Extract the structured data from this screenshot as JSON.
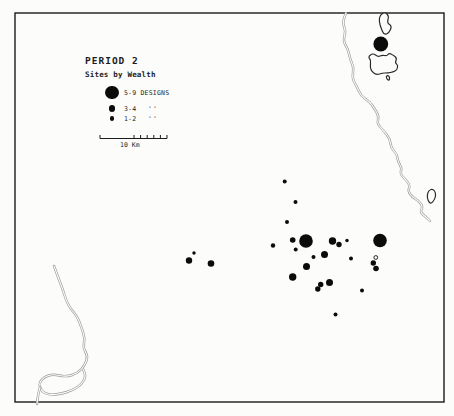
{
  "figure": {
    "title": "PERIOD 2",
    "subtitle": "Sites by Wealth",
    "legend": [
      {
        "label": "5-9 DESIGNS",
        "ditto": "",
        "radius": 6.8
      },
      {
        "label": "3-4",
        "ditto": "''",
        "radius": 3.4
      },
      {
        "label": "1-2",
        "ditto": "''",
        "radius": 2.1
      }
    ],
    "scale_bar": {
      "label": "10 Km"
    },
    "colors": {
      "ink": "#1c1c1c",
      "dot": "#0b0b0b",
      "river": "#9c9c9c",
      "island": "#2b2b2b",
      "background": "#fcfcfb"
    }
  },
  "chart_data": {
    "type": "scatter",
    "legend_entries": [
      "5-9 DESIGNS",
      "3-4 ''",
      "1-2 ''"
    ],
    "size_classes": {
      "5-9": 6.8,
      "3-4": 3.4,
      "1-2": 2
    },
    "frame": {
      "x": 15,
      "y": 13,
      "w": 429,
      "h": 389
    },
    "scale_bar": {
      "x1": 100,
      "x2": 167,
      "y": 138.5,
      "tick_h": 3.5,
      "ticks": [
        100,
        134,
        140.6,
        147.2,
        153.8,
        160.4,
        167
      ],
      "label": "10 Km"
    },
    "sites": [
      {
        "x": 284.7,
        "y": 181.5,
        "r": 2,
        "wealth": "1-2"
      },
      {
        "x": 295.5,
        "y": 202,
        "r": 2,
        "wealth": "1-2"
      },
      {
        "x": 287,
        "y": 222,
        "r": 2,
        "wealth": "1-2"
      },
      {
        "x": 273,
        "y": 245.5,
        "r": 2.2,
        "wealth": "1-2"
      },
      {
        "x": 292.7,
        "y": 240,
        "r": 2.8,
        "wealth": "3-4"
      },
      {
        "x": 306,
        "y": 241,
        "r": 6.8,
        "wealth": "5-9"
      },
      {
        "x": 295.7,
        "y": 249.5,
        "r": 2,
        "wealth": "1-2"
      },
      {
        "x": 313.5,
        "y": 257,
        "r": 2,
        "wealth": "1-2"
      },
      {
        "x": 324.5,
        "y": 254.5,
        "r": 3.5,
        "wealth": "3-4"
      },
      {
        "x": 332.5,
        "y": 241,
        "r": 3.7,
        "wealth": "3-4"
      },
      {
        "x": 339,
        "y": 244.5,
        "r": 2.7,
        "wealth": "3-4"
      },
      {
        "x": 347,
        "y": 240.5,
        "r": 1.7,
        "wealth": "1-2"
      },
      {
        "x": 351,
        "y": 258.5,
        "r": 2,
        "wealth": "1-2"
      },
      {
        "x": 306.5,
        "y": 266.5,
        "r": 3.5,
        "wealth": "3-4"
      },
      {
        "x": 292.7,
        "y": 277,
        "r": 3.7,
        "wealth": "3-4"
      },
      {
        "x": 320.7,
        "y": 284.5,
        "r": 2.7,
        "wealth": "3-4"
      },
      {
        "x": 329.5,
        "y": 282.5,
        "r": 3.5,
        "wealth": "3-4"
      },
      {
        "x": 317.8,
        "y": 289,
        "r": 2.7,
        "wealth": "3-4"
      },
      {
        "x": 335.5,
        "y": 314.5,
        "r": 2,
        "wealth": "1-2"
      },
      {
        "x": 362,
        "y": 290.5,
        "r": 2,
        "wealth": "1-2"
      },
      {
        "x": 380,
        "y": 240.5,
        "r": 6.8,
        "wealth": "5-9"
      },
      {
        "x": 373.3,
        "y": 263,
        "r": 2.7,
        "wealth": "3-4"
      },
      {
        "x": 376,
        "y": 268.5,
        "r": 2.8,
        "wealth": "3-4"
      },
      {
        "x": 194,
        "y": 253,
        "r": 1.7,
        "wealth": "1-2"
      },
      {
        "x": 189,
        "y": 260.5,
        "r": 3.2,
        "wealth": "3-4"
      },
      {
        "x": 211,
        "y": 263.5,
        "r": 3.3,
        "wealth": "3-4"
      },
      {
        "x": 380.8,
        "y": 44,
        "r": 7.4,
        "wealth": "5-9"
      }
    ],
    "open_circle_sites": [
      {
        "x": 375.8,
        "y": 257.5,
        "r": 1.9
      }
    ],
    "rivers": [
      {
        "name": "northeast-river",
        "points": [
          [
            346,
            13
          ],
          [
            342,
            22
          ],
          [
            346,
            31
          ],
          [
            343,
            41
          ],
          [
            348,
            49
          ],
          [
            350,
            59
          ],
          [
            354,
            68
          ],
          [
            352,
            78
          ],
          [
            357,
            87
          ],
          [
            361,
            96
          ],
          [
            370,
            102
          ],
          [
            374,
            108
          ],
          [
            379,
            116
          ],
          [
            377,
            124
          ],
          [
            384,
            131
          ],
          [
            390,
            139
          ],
          [
            391,
            148
          ],
          [
            397,
            154
          ],
          [
            398,
            162
          ],
          [
            402,
            168
          ],
          [
            400,
            174
          ],
          [
            407,
            181
          ],
          [
            410,
            186
          ],
          [
            408,
            191
          ],
          [
            412,
            197
          ],
          [
            419,
            201
          ],
          [
            423,
            207
          ],
          [
            420,
            212
          ],
          [
            426,
            217
          ],
          [
            430,
            221
          ]
        ]
      },
      {
        "name": "southwest-river",
        "points": [
          [
            54,
            266
          ],
          [
            58,
            277
          ],
          [
            63,
            290
          ],
          [
            66,
            300
          ],
          [
            70,
            308
          ],
          [
            77,
            316
          ],
          [
            81,
            326
          ],
          [
            85,
            338
          ],
          [
            83,
            348
          ],
          [
            88,
            356
          ],
          [
            85,
            365
          ],
          [
            78,
            373
          ],
          [
            66,
            377
          ],
          [
            53,
            374
          ],
          [
            44,
            377
          ],
          [
            39,
            383
          ],
          [
            41,
            391
          ],
          [
            49,
            395
          ],
          [
            61,
            394
          ],
          [
            73,
            390
          ],
          [
            82,
            384
          ],
          [
            86,
            376
          ],
          [
            83,
            369
          ]
        ]
      },
      {
        "name": "southwest-river-outlet",
        "points": [
          [
            40,
            387
          ],
          [
            38,
            395
          ],
          [
            37,
            404
          ]
        ]
      }
    ],
    "islands": [
      {
        "name": "north-islet",
        "points": [
          [
            380,
            15
          ],
          [
            385,
            12
          ],
          [
            389,
            16
          ],
          [
            387,
            23
          ],
          [
            392,
            26
          ],
          [
            389,
            33
          ],
          [
            384,
            35
          ],
          [
            381,
            28
          ],
          [
            379,
            21
          ]
        ]
      },
      {
        "name": "large-island",
        "points": [
          [
            373,
            53
          ],
          [
            378,
            57
          ],
          [
            382,
            55
          ],
          [
            387,
            56
          ],
          [
            389,
            53
          ],
          [
            393,
            55
          ],
          [
            397,
            58
          ],
          [
            395,
            63
          ],
          [
            398,
            65
          ],
          [
            397,
            70
          ],
          [
            393,
            72
          ],
          [
            388,
            73
          ],
          [
            382,
            73
          ],
          [
            377,
            75
          ],
          [
            372,
            72
          ],
          [
            370,
            67
          ],
          [
            371,
            60
          ],
          [
            368,
            57
          ]
        ]
      },
      {
        "name": "island-tail",
        "points": [
          [
            387,
            75
          ],
          [
            390,
            77
          ],
          [
            389,
            81
          ],
          [
            386,
            78
          ]
        ]
      },
      {
        "name": "east-islet",
        "points": [
          [
            429,
            190
          ],
          [
            433,
            189
          ],
          [
            436,
            193
          ],
          [
            435,
            199
          ],
          [
            431,
            204
          ],
          [
            428,
            201
          ],
          [
            427,
            195
          ]
        ]
      }
    ]
  }
}
